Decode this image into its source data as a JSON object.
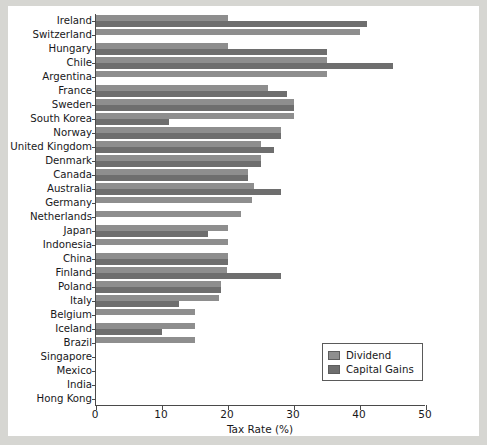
{
  "chart_data": {
    "type": "bar",
    "orientation": "horizontal",
    "title": "",
    "xlabel": "Tax Rate (%)",
    "ylabel": "",
    "xlim": [
      0,
      50
    ],
    "xticks": [
      0,
      10,
      20,
      30,
      40,
      50
    ],
    "grid": false,
    "legend_position": "lower-right",
    "categories": [
      "Ireland",
      "Switzerland",
      "Hungary",
      "Chile",
      "Argentina",
      "France",
      "Sweden",
      "South Korea",
      "Norway",
      "United Kingdom",
      "Denmark",
      "Canada",
      "Australia",
      "Germany",
      "Netherlands",
      "Japan",
      "Indonesia",
      "China",
      "Finland",
      "Poland",
      "Italy",
      "Belgium",
      "Iceland",
      "Brazil",
      "Singapore",
      "Mexico",
      "India",
      "Hong Kong"
    ],
    "series": [
      {
        "name": "Dividend",
        "color": "#8e8e8e",
        "values": [
          20,
          40,
          20,
          35,
          35,
          26,
          30,
          30,
          28,
          25,
          25,
          23,
          24,
          23.6,
          22,
          20,
          20,
          20,
          19.8,
          19,
          18.6,
          15,
          15,
          15,
          0,
          0,
          0,
          0
        ]
      },
      {
        "name": "Capital Gains",
        "color": "#6e6e6e",
        "values": [
          41,
          0,
          35,
          45,
          0,
          29,
          30,
          11,
          28,
          27,
          25,
          23,
          28,
          0,
          0,
          17,
          0,
          20,
          28,
          19,
          12.5,
          0,
          10,
          0,
          0,
          0,
          0,
          0
        ]
      }
    ]
  },
  "legend": {
    "items": [
      {
        "label": "Dividend",
        "color": "#8e8e8e"
      },
      {
        "label": "Capital Gains",
        "color": "#6e6e6e"
      }
    ]
  },
  "axis": {
    "x_title": "Tax Rate (%)",
    "x_tick_labels": [
      "0",
      "10",
      "20",
      "30",
      "40",
      "50"
    ]
  }
}
